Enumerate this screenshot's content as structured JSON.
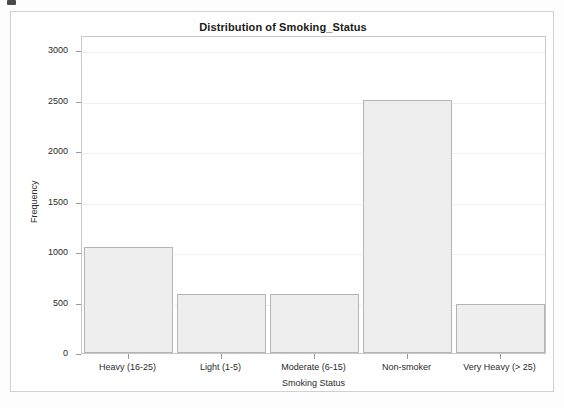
{
  "figure": {
    "title": "Distribution of Smoking_Status",
    "background": "#ffffff",
    "frame_color": "#d0d0d0"
  },
  "chart_data": {
    "type": "bar",
    "title": "Distribution of Smoking_Status",
    "xlabel": "Smoking Status",
    "ylabel": "Frequency",
    "categories": [
      "Heavy (16-25)",
      "Light (1-5)",
      "Moderate (6-15)",
      "Non-smoker",
      "Very Heavy (> 25)"
    ],
    "values": [
      1050,
      580,
      580,
      2510,
      490
    ],
    "ylim": [
      0,
      3150
    ],
    "yticks": [
      0,
      500,
      1000,
      1500,
      2000,
      2500,
      3000
    ],
    "ytick_labels": [
      "0",
      "500",
      "1000",
      "1500",
      "2000",
      "2500",
      "3000"
    ],
    "grid": true,
    "legend": null,
    "bar_fill": "#eeeeee",
    "bar_edge": "#b4b4b4"
  }
}
